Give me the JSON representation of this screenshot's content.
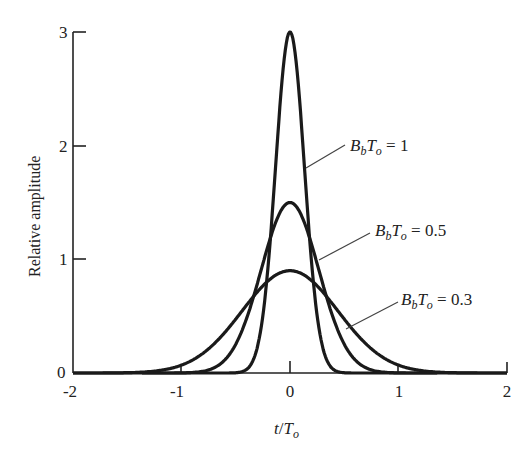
{
  "chart_data": {
    "type": "line",
    "title": "",
    "xlabel": "t/T_o",
    "ylabel": "Relative amplitude",
    "xlim": [
      -2,
      2
    ],
    "ylim": [
      0,
      3
    ],
    "xticks": [
      "-2",
      "-1",
      "0",
      "1",
      "2"
    ],
    "yticks": [
      "0",
      "1",
      "2",
      "3"
    ],
    "grid": false,
    "legend": "inline annotations with leader lines",
    "series": [
      {
        "name": "B_bT_o = 1",
        "param": 1.0,
        "peak": 3.0,
        "x": [
          -1,
          -0.75,
          -0.5,
          -0.4,
          -0.3,
          -0.2,
          -0.1,
          0,
          0.1,
          0.2,
          0.3,
          0.4,
          0.5,
          0.75,
          1
        ],
        "values": [
          0,
          0,
          0.02,
          0.03,
          0.23,
          0.96,
          2.27,
          3.0,
          2.27,
          0.96,
          0.23,
          0.03,
          0.02,
          0,
          0
        ]
      },
      {
        "name": "B_bT_o = 0.5",
        "param": 0.5,
        "peak": 1.5,
        "x": [
          -1.5,
          -1,
          -0.75,
          -0.5,
          -0.25,
          0,
          0.25,
          0.5,
          0.75,
          1,
          1.5
        ],
        "values": [
          0,
          0.01,
          0.03,
          0.25,
          0.85,
          1.5,
          0.85,
          0.25,
          0.03,
          0.01,
          0
        ]
      },
      {
        "name": "B_bT_o = 0.3",
        "param": 0.3,
        "peak": 0.9,
        "x": [
          -2,
          -1.5,
          -1,
          -0.75,
          -0.5,
          -0.25,
          0,
          0.25,
          0.5,
          0.75,
          1,
          1.5,
          2
        ],
        "values": [
          0,
          0.01,
          0.07,
          0.21,
          0.47,
          0.75,
          0.9,
          0.75,
          0.47,
          0.21,
          0.07,
          0.01,
          0
        ]
      }
    ],
    "annotations": [
      {
        "text": "B_bT_o = 1",
        "series": 0
      },
      {
        "text": "B_bT_o = 0.5",
        "series": 1
      },
      {
        "text": "B_bT_o = 0.3",
        "series": 2
      }
    ]
  },
  "labels": {
    "ylabel": "Relative amplitude",
    "xlabel_t": "t",
    "xlabel_slash": "/",
    "xlabel_T": "T",
    "xlabel_sub": "o",
    "ann": [
      {
        "B": "B",
        "b": "b",
        "T": "T",
        "o": "o",
        "eq": " = 1"
      },
      {
        "B": "B",
        "b": "b",
        "T": "T",
        "o": "o",
        "eq": " = 0.5"
      },
      {
        "B": "B",
        "b": "b",
        "T": "T",
        "o": "o",
        "eq": " = 0.3"
      }
    ]
  }
}
